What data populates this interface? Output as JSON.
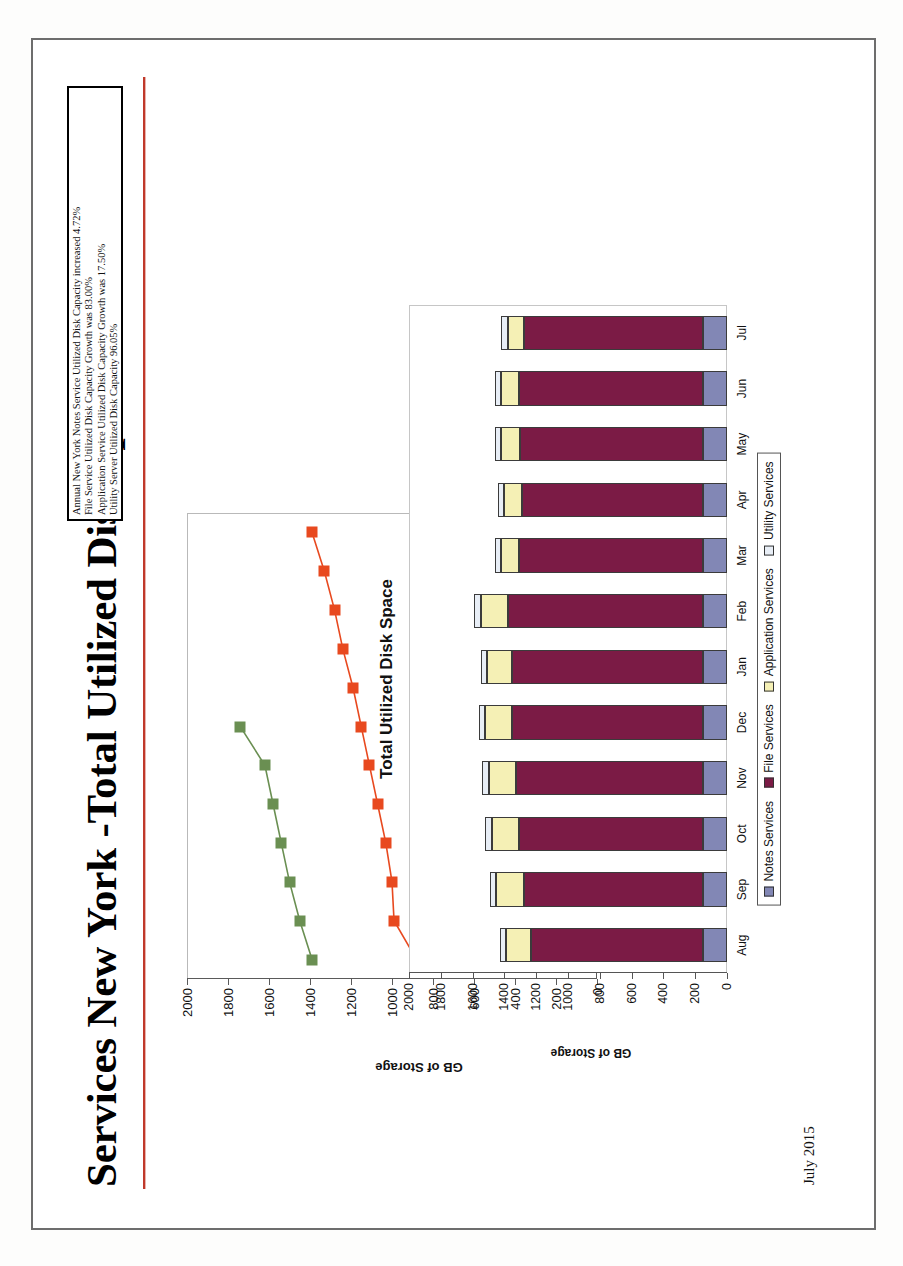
{
  "slide": {
    "title": "Services New York -Total Utilized Disk Space",
    "footer_date": "July 2015",
    "accent_rule_color": "#c0392b"
  },
  "notes_box": {
    "lines": [
      "Annual New York Notes Service Utilized Disk Capacity increased 4.72%",
      "File Service Utilized Disk Capacity Growth was 83.00%",
      "Application Service Utilized Disk Capacity Growth was 17.50%",
      "Utility Server Utilized Disk Capacity 96.05%"
    ]
  },
  "chart_data": [
    {
      "type": "line",
      "name": "annual-comparison-line-chart",
      "title": "",
      "xlabel": "",
      "ylabel": "GB of Storage",
      "ylim": [
        0,
        2000
      ],
      "yticks": [
        0,
        200,
        400,
        600,
        800,
        1000,
        1200,
        1400,
        1600,
        1800,
        2000
      ],
      "grid": false,
      "legend_position": "inside-bottom-right",
      "categories": [
        "Jan",
        "Feb",
        "Mar",
        "Apr",
        "May",
        "Jun",
        "Jul",
        "Aug",
        "Sep",
        "Oct",
        "Nov",
        "Dec"
      ],
      "series": [
        {
          "name": "2014",
          "color": "#e8491f",
          "marker": "square",
          "values": [
            880,
            990,
            1000,
            1030,
            1070,
            1110,
            1150,
            1190,
            1240,
            1280,
            1330,
            1390
          ]
        },
        {
          "name": "2015",
          "color": "#6a8f52",
          "marker": "square",
          "values": [
            1390,
            1450,
            1500,
            1540,
            1580,
            1620,
            1740,
            null,
            null,
            null,
            null,
            null
          ]
        }
      ]
    },
    {
      "type": "bar",
      "name": "total-utilized-disk-space-stacked-bar",
      "stacked": true,
      "title": "Total Utilized Disk Space",
      "xlabel": "",
      "ylabel": "GB of Storage",
      "ylim": [
        0,
        2000
      ],
      "yticks": [
        0,
        200,
        400,
        600,
        800,
        1000,
        1200,
        1400,
        1600,
        1800,
        2000
      ],
      "grid": false,
      "legend_position": "bottom",
      "categories": [
        "Aug",
        "Sep",
        "Oct",
        "Nov",
        "Dec",
        "Jan",
        "Feb",
        "Mar",
        "Apr",
        "May",
        "Jun",
        "Jul"
      ],
      "series": [
        {
          "name": "Notes Services",
          "color": "#8287b5",
          "values": [
            150,
            150,
            150,
            150,
            150,
            150,
            150,
            150,
            150,
            150,
            150,
            150
          ]
        },
        {
          "name": "File Services",
          "color": "#7b1b45",
          "values": [
            1080,
            1130,
            1160,
            1180,
            1200,
            1200,
            1230,
            1160,
            1140,
            1150,
            1160,
            1130
          ]
        },
        {
          "name": "Application Services",
          "color": "#f5f0b5",
          "values": [
            160,
            170,
            170,
            170,
            170,
            160,
            170,
            110,
            110,
            120,
            110,
            100
          ]
        },
        {
          "name": "Utility Services",
          "color": "#e8eef6",
          "values": [
            40,
            40,
            40,
            40,
            40,
            40,
            40,
            40,
            40,
            40,
            40,
            40
          ]
        }
      ]
    }
  ]
}
